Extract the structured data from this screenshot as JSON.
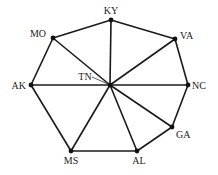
{
  "diagram": {
    "type": "graph",
    "nodes": [
      {
        "id": "KY",
        "label": "KY",
        "x": 111,
        "y": 20,
        "lx": 111,
        "ly": 14,
        "anchor": "middle"
      },
      {
        "id": "MO",
        "label": "MO",
        "x": 53,
        "y": 38,
        "lx": 46,
        "ly": 37,
        "anchor": "end"
      },
      {
        "id": "VA",
        "label": "VA",
        "x": 175,
        "y": 39,
        "lx": 180,
        "ly": 39,
        "anchor": "start"
      },
      {
        "id": "AK",
        "label": "AK",
        "x": 31,
        "y": 85,
        "lx": 26,
        "ly": 89,
        "anchor": "end"
      },
      {
        "id": "NC",
        "label": "NC",
        "x": 188,
        "y": 85,
        "lx": 192,
        "ly": 89,
        "anchor": "start"
      },
      {
        "id": "TN",
        "label": "TN",
        "x": 110,
        "y": 85,
        "lx": 85,
        "ly": 80,
        "anchor": "middle"
      },
      {
        "id": "GA",
        "label": "GA",
        "x": 172,
        "y": 127,
        "lx": 176,
        "ly": 138,
        "anchor": "start"
      },
      {
        "id": "MS",
        "label": "MS",
        "x": 71,
        "y": 151,
        "lx": 71,
        "ly": 164,
        "anchor": "middle"
      },
      {
        "id": "AL",
        "label": "AL",
        "x": 137,
        "y": 151,
        "lx": 139,
        "ly": 164,
        "anchor": "middle"
      }
    ],
    "edges": [
      [
        "KY",
        "MO"
      ],
      [
        "KY",
        "VA"
      ],
      [
        "KY",
        "TN"
      ],
      [
        "MO",
        "AK"
      ],
      [
        "MO",
        "TN"
      ],
      [
        "VA",
        "NC"
      ],
      [
        "VA",
        "TN"
      ],
      [
        "AK",
        "TN"
      ],
      [
        "AK",
        "MS"
      ],
      [
        "TN",
        "NC"
      ],
      [
        "TN",
        "GA"
      ],
      [
        "TN",
        "AL"
      ],
      [
        "TN",
        "MS"
      ],
      [
        "NC",
        "GA"
      ],
      [
        "GA",
        "AL"
      ],
      [
        "MS",
        "AL"
      ]
    ],
    "tn_leader": {
      "x1": 92,
      "y1": 77,
      "x2": 108,
      "y2": 84
    }
  }
}
